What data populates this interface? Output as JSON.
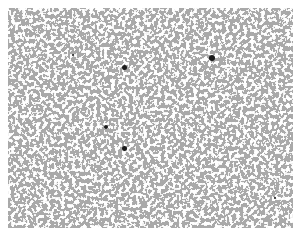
{
  "image": {
    "description": "Grayscale micrograph-like texture with scattered light speckles and a few dark particles",
    "background_color": "#ffffff",
    "texture_base_color": "#a8a8a8",
    "speckle_color": "#e6e6e6",
    "particle_color": "#1a1a1a",
    "frame": {
      "x": 8,
      "y": 8,
      "width": 285,
      "height": 220
    }
  },
  "particles": [
    {
      "x": 124,
      "y": 67,
      "r": 2.5
    },
    {
      "x": 212,
      "y": 58,
      "r": 3
    },
    {
      "x": 106,
      "y": 127,
      "r": 2
    },
    {
      "x": 124,
      "y": 148,
      "r": 2.5
    },
    {
      "x": 275,
      "y": 198,
      "r": 1.2
    },
    {
      "x": 73,
      "y": 55,
      "r": 1
    }
  ]
}
